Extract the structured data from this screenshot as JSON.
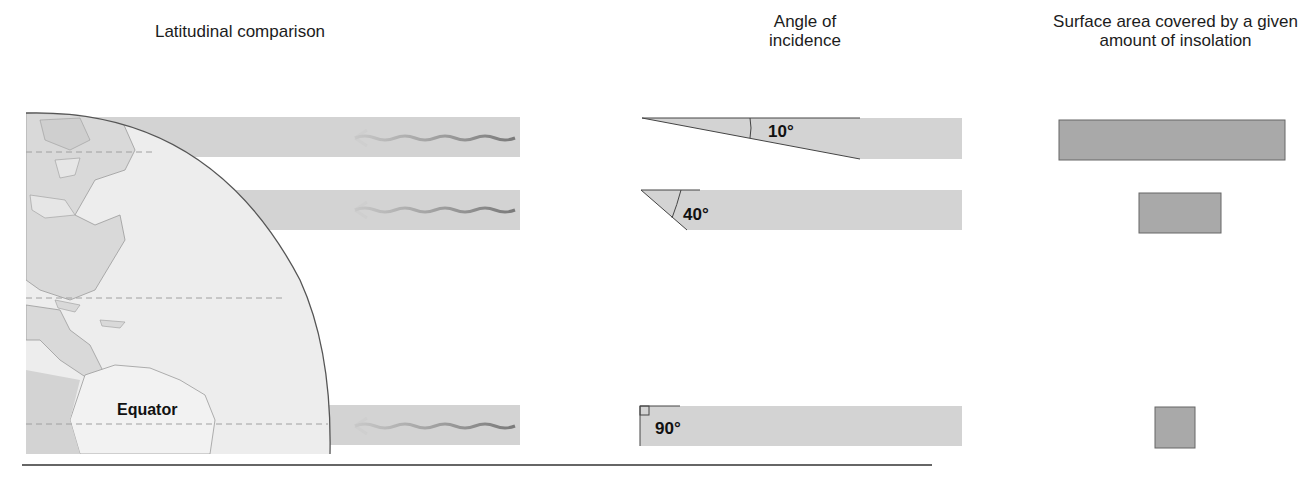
{
  "headers": {
    "latitudinal": "Latitudinal comparison",
    "angle": "Angle of incidence",
    "area": "Surface area covered by a given amount of insolation"
  },
  "globe": {
    "equator_label": "Equator"
  },
  "rows": [
    {
      "id": "high-latitude",
      "angle_label": "10°",
      "angle_deg": 10,
      "area_width_px": 226
    },
    {
      "id": "mid-latitude",
      "angle_label": "40°",
      "angle_deg": 40,
      "area_width_px": 82
    },
    {
      "id": "equator",
      "angle_label": "90°",
      "angle_deg": 90,
      "area_width_px": 40
    }
  ],
  "colors": {
    "beam": "#d3d3d3",
    "globe": "#ececec",
    "land": "#d6d6d6",
    "area_box": "#a9a9a9",
    "wave": "#8a8a8a"
  }
}
